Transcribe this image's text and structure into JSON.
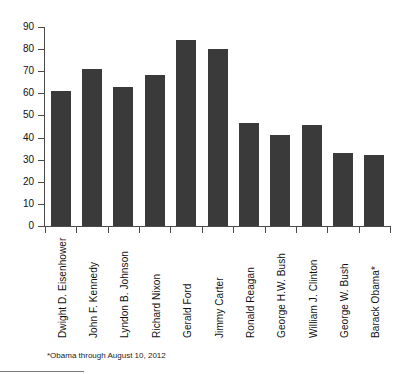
{
  "chart_data": {
    "type": "bar",
    "title": "",
    "subtitle": "",
    "xlabel": "",
    "ylabel": "",
    "ylim": [
      0,
      90
    ],
    "yticks": [
      0,
      10,
      20,
      30,
      40,
      50,
      60,
      70,
      80,
      90
    ],
    "grid": false,
    "legend": null,
    "bar_color": "#3a3a3a",
    "axis_color": "#4a4a4a",
    "categories": [
      "Dwight D. Eisenhower",
      "John F. Kennedy",
      "Lyndon B. Johnson",
      "Richard Nixon",
      "Gerald Ford",
      "Jimmy Carter",
      "Ronald Reagan",
      "George H.W. Bush",
      "William J. Clinton",
      "George W. Bush",
      "Barack Obama*"
    ],
    "values": [
      61,
      71,
      63,
      68.5,
      84,
      80,
      46.5,
      41,
      45.5,
      33,
      32
    ],
    "annotations": [
      "*Obama through August 10, 2012"
    ]
  },
  "footnote": {
    "text": "*Obama through August 10, 2012"
  }
}
